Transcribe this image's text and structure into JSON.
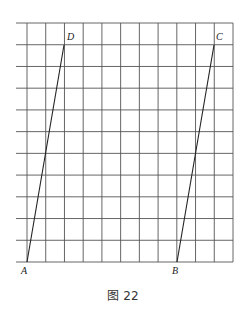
{
  "figure": {
    "caption": "图 22",
    "grid": {
      "left": 16,
      "first_col_x": 27,
      "right": 233,
      "top": 23,
      "bottom": 262,
      "columns": 11,
      "rows": 11,
      "line_color": "#555555"
    },
    "points": {
      "A": {
        "label": "A",
        "x": 27,
        "y": 262
      },
      "B": {
        "label": "B",
        "x": 177,
        "y": 262
      },
      "C": {
        "label": "C",
        "x": 214,
        "y": 45
      },
      "D": {
        "label": "D",
        "x": 64,
        "y": 45
      }
    },
    "segments": [
      {
        "from": "A",
        "to": "D"
      },
      {
        "from": "B",
        "to": "C"
      }
    ]
  }
}
